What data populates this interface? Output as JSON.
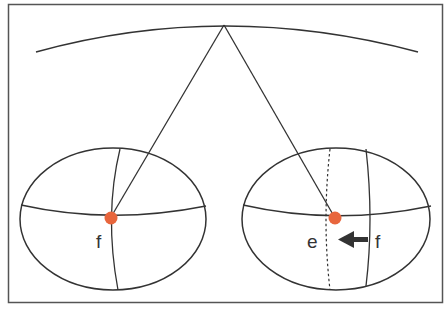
{
  "diagram": {
    "colors": {
      "line": "#333333",
      "point": "#e8663d",
      "frame": "#555555",
      "background": "#ffffff"
    },
    "labels": {
      "left_point": "f",
      "right_point_current": "e",
      "right_point_previous": "f"
    },
    "elements": [
      "top-arc-with-apex-point",
      "left-ellipse-globe-with-point-f",
      "right-ellipse-globe-with-point-e",
      "dotted-meridian-right",
      "arrow-from-f-to-e"
    ]
  }
}
